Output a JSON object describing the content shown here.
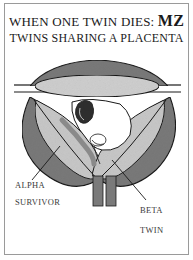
{
  "title": {
    "line1_prefix": "WHEN ONE TWIN DIES: ",
    "line1_emphasis": "MZ",
    "line2": "TWINS SHARING A PLACENTA"
  },
  "labels": {
    "alpha_line1": "ALPHA",
    "alpha_line2": "SURVIVOR",
    "beta_line1": "BETA",
    "beta_line2": "TWIN"
  },
  "colors": {
    "dark_band": "#7a7a7a",
    "light_fill": "#c8c8c8",
    "outline": "#1a1a1a",
    "fetus": "#3a3a3a",
    "frame": "#9a9a9a"
  }
}
